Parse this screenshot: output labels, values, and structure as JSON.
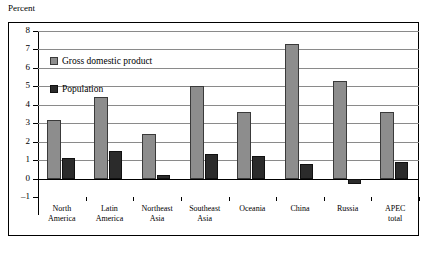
{
  "chart_data": {
    "type": "bar",
    "title": "",
    "ylabel": "Percent",
    "xlabel": "",
    "ylim": [
      -1,
      8
    ],
    "yticks": [
      -1,
      0,
      1,
      2,
      3,
      4,
      5,
      6,
      7,
      8
    ],
    "grid": true,
    "legend_position": "inside-top-left",
    "categories": [
      "North America",
      "Latin America",
      "Northeast Asia",
      "Southeast Asia",
      "Oceania",
      "China",
      "Russia",
      "APEC total"
    ],
    "category_lines": [
      [
        "North",
        "America"
      ],
      [
        "Latin",
        "America"
      ],
      [
        "Northeast",
        "Asia"
      ],
      [
        "Southeast",
        "Asia"
      ],
      [
        "Oceania",
        ""
      ],
      [
        "China",
        ""
      ],
      [
        "Russia",
        ""
      ],
      [
        "APEC",
        "total"
      ]
    ],
    "series": [
      {
        "name": "Gross domestic product",
        "color": "#8d8d8d",
        "values": [
          3.2,
          4.4,
          2.4,
          5.0,
          3.6,
          7.3,
          5.3,
          3.6
        ]
      },
      {
        "name": "Population",
        "color": "#2b2b2b",
        "values": [
          1.1,
          1.5,
          0.2,
          1.35,
          1.2,
          0.8,
          -0.3,
          0.9
        ]
      }
    ]
  },
  "legend": {
    "items": [
      {
        "label": "Gross domestic product",
        "swatch": "gdp"
      },
      {
        "label": "Population",
        "swatch": "pop"
      }
    ]
  }
}
